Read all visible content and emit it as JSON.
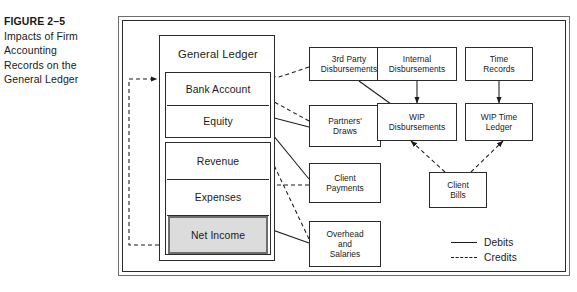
{
  "caption": {
    "figure_number": "FIGURE 2–5",
    "title_lines": [
      "Impacts of Firm",
      "Accounting",
      "Records on the",
      "General Ledger"
    ]
  },
  "diagram": {
    "general_ledger": {
      "title": "General Ledger",
      "accounts": [
        {
          "label": "Bank Account",
          "highlighted": false
        },
        {
          "label": "Equity",
          "highlighted": false
        },
        {
          "label": "Revenue",
          "highlighted": false
        },
        {
          "label": "Expenses",
          "highlighted": false
        },
        {
          "label": "Net Income",
          "highlighted": true
        }
      ]
    },
    "nodes": [
      {
        "id": "third-party-disbursements",
        "label": "3rd Party\nDisbursements",
        "lines": [
          "3rd Party",
          "Disbursements"
        ]
      },
      {
        "id": "internal-disbursements",
        "label": "Internal\nDisbursements",
        "lines": [
          "Internal",
          "Disbursements"
        ]
      },
      {
        "id": "time-records",
        "label": "Time\nRecords",
        "lines": [
          "Time",
          "Records"
        ]
      },
      {
        "id": "partners-draws",
        "label": "Partners' Draws",
        "lines": [
          "Partners'",
          "Draws"
        ]
      },
      {
        "id": "wip-disbursements",
        "label": "WIP Disbursements",
        "lines": [
          "WIP",
          "Disbursements"
        ]
      },
      {
        "id": "wip-time-ledger",
        "label": "WIP Time Ledger",
        "lines": [
          "WIP Time",
          "Ledger"
        ]
      },
      {
        "id": "client-payments",
        "label": "Client Payments",
        "lines": [
          "Client",
          "Payments"
        ]
      },
      {
        "id": "client-bills",
        "label": "Client Bills",
        "lines": [
          "Client",
          "Bills"
        ]
      },
      {
        "id": "overhead-and-salaries",
        "label": "Overhead and Salaries",
        "lines": [
          "Overhead",
          "and",
          "Salaries"
        ]
      }
    ],
    "legend": {
      "items": [
        {
          "style": "solid",
          "label": "Debits"
        },
        {
          "style": "dashed",
          "label": "Credits"
        }
      ]
    },
    "edges": [
      {
        "from": "third-party-disbursements",
        "to": "bank-account",
        "type": "credit"
      },
      {
        "from": "third-party-disbursements",
        "to": "wip-disbursements",
        "type": "debit"
      },
      {
        "from": "partners-draws",
        "to": "bank-account",
        "type": "credit"
      },
      {
        "from": "partners-draws",
        "to": "equity",
        "type": "debit"
      },
      {
        "from": "client-payments",
        "to": "bank-account",
        "type": "debit"
      },
      {
        "from": "client-payments",
        "to": "revenue",
        "type": "credit"
      },
      {
        "from": "overhead-and-salaries",
        "to": "bank-account",
        "type": "credit"
      },
      {
        "from": "overhead-and-salaries",
        "to": "expenses",
        "type": "debit"
      },
      {
        "from": "internal-disbursements",
        "to": "wip-disbursements",
        "type": "debit"
      },
      {
        "from": "time-records",
        "to": "wip-time-ledger",
        "type": "debit"
      },
      {
        "from": "client-bills",
        "to": "wip-disbursements",
        "type": "credit"
      },
      {
        "from": "client-bills",
        "to": "wip-time-ledger",
        "type": "credit"
      },
      {
        "from": "net-income",
        "to": "equity",
        "type": "credit"
      }
    ]
  },
  "colors": {
    "highlight_fill": "#dcdcdc",
    "stroke": "#1a1a1a",
    "frame_outer": "#6e6e6e"
  }
}
